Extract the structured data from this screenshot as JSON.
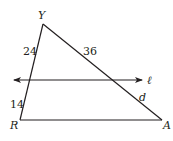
{
  "diagram": {
    "type": "triangle-with-parallel-line",
    "vertices": {
      "Y": {
        "label": "Y",
        "x": 43,
        "y": 24
      },
      "R": {
        "label": "R",
        "x": 20,
        "y": 120
      },
      "A": {
        "label": "A",
        "x": 162,
        "y": 120
      }
    },
    "parallel_line": {
      "label": "ℓ",
      "y": 80,
      "x_start": 13,
      "x_end": 143,
      "arrows": "both"
    },
    "segment_labels": {
      "upper_left_side": "24",
      "lower_left_side": "14",
      "upper_right_side": "36",
      "lower_right_side": "d"
    },
    "colors": {
      "stroke": "#231f20",
      "background": "#ffffff"
    }
  }
}
